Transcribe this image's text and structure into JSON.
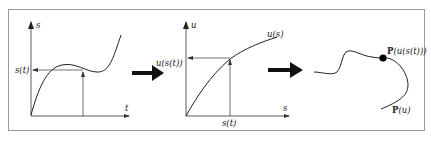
{
  "figure": {
    "colors": {
      "frame": "#9a9a9a",
      "ink": "#222222",
      "background": "#ffffff"
    },
    "panels": [
      {
        "id": "s-of-t",
        "x_axis_label": "t",
        "y_axis_label": "s",
        "value_label": "s(t)",
        "curve_shape": "cubic: rises, local max, local min, rises steeply"
      },
      {
        "id": "u-of-s",
        "x_axis_label": "s",
        "y_axis_label": "u",
        "curve_label": "u(s)",
        "input_label": "s(t)",
        "value_label": "u(s(t))",
        "curve_shape": "monotone increasing, concave"
      },
      {
        "id": "curve-P",
        "curve_label": "P(u)",
        "point_label": "P(u(s(t)))",
        "point_label_parts": {
          "func": "P",
          "arg": "(u(s(t)))"
        },
        "curve_label_parts": {
          "func": "P",
          "arg": "(u)"
        }
      }
    ],
    "transition_arrows": [
      "arrow-right",
      "arrow-right"
    ]
  }
}
